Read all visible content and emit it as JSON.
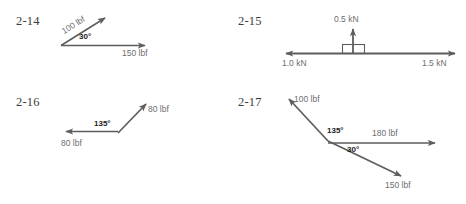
{
  "page": {
    "background_color": "#ffffff",
    "arrow_color": "#5d5d5d",
    "label_color": "#6e6e6e",
    "angle_color": "#1c1c1c",
    "problem_number_color": "#3a3a3a"
  },
  "problems": [
    {
      "id": "2-14",
      "number_label": "2-14",
      "type": "two-force-vector-diagram",
      "vectors": [
        {
          "name": "vector-100-lbf",
          "label": "100 lbf",
          "magnitude": 100,
          "unit": "lbf",
          "direction_deg": 32
        },
        {
          "name": "vector-150-lbf",
          "label": "150 lbf",
          "magnitude": 150,
          "unit": "lbf",
          "direction_deg": 0
        }
      ],
      "angles": [
        {
          "name": "angle-30",
          "label": "30°",
          "value": 30
        }
      ]
    },
    {
      "id": "2-15",
      "number_label": "2-15",
      "type": "block-with-three-forces",
      "vectors": [
        {
          "name": "vector-0-5-kn",
          "label": "0.5 kN",
          "magnitude": 0.5,
          "unit": "kN",
          "direction_deg": 90
        },
        {
          "name": "vector-1-0-kn",
          "label": "1.0 kN",
          "magnitude": 1.0,
          "unit": "kN",
          "direction_deg": 180
        },
        {
          "name": "vector-1-5-kn",
          "label": "1.5 kN",
          "magnitude": 1.5,
          "unit": "kN",
          "direction_deg": 0
        }
      ],
      "angles": []
    },
    {
      "id": "2-16",
      "number_label": "2-16",
      "type": "two-force-vector-diagram",
      "vectors": [
        {
          "name": "vector-80-lbf-upper",
          "label": "80 lbf",
          "magnitude": 80,
          "unit": "lbf",
          "direction_deg": 45
        },
        {
          "name": "vector-80-lbf-left",
          "label": "80 lbf",
          "magnitude": 80,
          "unit": "lbf",
          "direction_deg": 180
        }
      ],
      "angles": [
        {
          "name": "angle-135",
          "label": "135°",
          "value": 135
        }
      ]
    },
    {
      "id": "2-17",
      "number_label": "2-17",
      "type": "three-force-vector-diagram",
      "vectors": [
        {
          "name": "vector-100-lbf",
          "label": "100 lbf",
          "magnitude": 100,
          "unit": "lbf",
          "direction_deg": 135
        },
        {
          "name": "vector-180-lbf",
          "label": "180 lbf",
          "magnitude": 180,
          "unit": "lbf",
          "direction_deg": 0
        },
        {
          "name": "vector-150-lbf",
          "label": "150 lbf",
          "magnitude": 150,
          "unit": "lbf",
          "direction_deg": -30
        }
      ],
      "angles": [
        {
          "name": "angle-135",
          "label": "135°",
          "value": 135
        },
        {
          "name": "angle-30",
          "label": "30°",
          "value": 30
        }
      ]
    }
  ]
}
